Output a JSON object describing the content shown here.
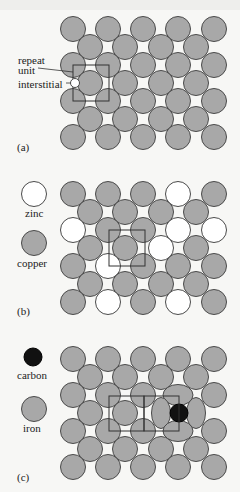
{
  "colors": {
    "background": "#f7f7f5",
    "atom_fill": "#a8a8a8",
    "atom_stroke": "#4a4a4a",
    "zinc_fill": "#ffffff",
    "carbon_fill": "#111111",
    "box_stroke": "#333333"
  },
  "lattice": {
    "x_odd": [
      73,
      108,
      143,
      178,
      214
    ],
    "x_even": [
      90,
      125,
      161,
      196
    ],
    "row_spacing": 18,
    "radius": 12.5
  },
  "panels": [
    {
      "id": "a",
      "tag": "(a)",
      "tag_pos": [
        17,
        142
      ],
      "row0_y": 29,
      "pattern": [
        "GGGGG",
        "GGGG",
        "GGGGG",
        "GGGG",
        "GGGGG",
        "GGGG",
        "GGGGG"
      ],
      "labels": [
        {
          "text": "repeat",
          "x": 18,
          "y": 55
        },
        {
          "text": "unit",
          "x": 18,
          "y": 65
        },
        {
          "text": "interstitial",
          "x": 18,
          "y": 79
        }
      ],
      "repeat_unit_box": {
        "x": 73,
        "y": 65,
        "w": 36,
        "h": 36
      },
      "interstitial": {
        "cx": 75,
        "cy": 83,
        "r": 4.5
      },
      "leader_lines": [
        {
          "x1": 38,
          "y1": 68,
          "x2": 73,
          "y2": 72
        },
        {
          "x1": 66,
          "y1": 83,
          "x2": 70.5,
          "y2": 83
        }
      ]
    },
    {
      "id": "b",
      "tag": "(b)",
      "tag_pos": [
        17,
        306
      ],
      "row0_y": 194,
      "pattern": [
        "GGGWG",
        "GGGG",
        "WGGWW",
        "GGWG",
        "GWGGG",
        "GGGG",
        "GWGWG"
      ],
      "legend": [
        {
          "kind": "zinc",
          "label": "zinc",
          "cx": 34,
          "cy": 194,
          "r": 12.5,
          "lx": 25,
          "ly": 208
        },
        {
          "kind": "copper",
          "label": "copper",
          "cx": 34,
          "cy": 243,
          "r": 12.5,
          "lx": 17,
          "ly": 258
        }
      ],
      "repeat_unit_box": {
        "x": 109,
        "y": 230,
        "w": 36,
        "h": 36
      }
    },
    {
      "id": "c",
      "tag": "(c)",
      "tag_pos": [
        17,
        472
      ],
      "row0_y": 359,
      "pattern": [
        "GGGGG",
        "GGGG",
        "GGGXG",
        "GGXX",
        "GGGXG",
        "GGGG",
        "GGGGG"
      ],
      "legend": [
        {
          "kind": "carbon",
          "label": "carbon",
          "cx": 33,
          "cy": 357,
          "r": 9,
          "lx": 17,
          "ly": 370
        },
        {
          "kind": "iron",
          "label": "iron",
          "cx": 34,
          "cy": 409,
          "r": 12.5,
          "lx": 23,
          "ly": 423
        }
      ],
      "distorted": [
        {
          "cx": 178,
          "cy": 395,
          "rx": 15,
          "ry": 10.5
        },
        {
          "cx": 161,
          "cy": 413,
          "rx": 9.5,
          "ry": 15.5
        },
        {
          "cx": 196,
          "cy": 413,
          "rx": 9.5,
          "ry": 15.5
        },
        {
          "cx": 178,
          "cy": 431,
          "rx": 15,
          "ry": 10.5
        }
      ],
      "carbon_atom": {
        "cx": 179,
        "cy": 413,
        "r": 9
      },
      "boxes": [
        {
          "x": 109,
          "y": 396,
          "w": 35,
          "h": 35
        },
        {
          "x": 144,
          "y": 396,
          "w": 35,
          "h": 35
        }
      ],
      "distorted_box": {
        "points": "144,396 180,395 180,431 144,431"
      }
    }
  ]
}
